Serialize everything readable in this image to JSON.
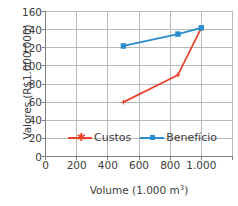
{
  "chart_data": {
    "type": "line",
    "title": "",
    "subtitle": "",
    "xlabel": "Volume (1.000 m³)",
    "xlabel_base": "Volume (1.000 m",
    "xlabel_sup": "3",
    "xlabel_tail": ")",
    "ylabel": "Valores (R$1.000.000)",
    "xlim": [
      0,
      1200
    ],
    "ylim": [
      0,
      160
    ],
    "xticks": [
      0,
      200,
      400,
      600,
      800,
      1000,
      1200
    ],
    "xticklabels": [
      "0",
      "200",
      "400",
      "600",
      "800",
      "1.000",
      ""
    ],
    "yticks": [
      0,
      20,
      40,
      60,
      80,
      100,
      120,
      140,
      160
    ],
    "yticklabels": [
      "0",
      "20",
      "40",
      "60",
      "80",
      "100",
      "120",
      "140",
      "160"
    ],
    "grid": true,
    "grid_color": "#b3b3b3",
    "legend_position": "inside-lower-center",
    "series": [
      {
        "name": "Custos",
        "color": "#E8412C",
        "marker": "star",
        "x": [
          500,
          850,
          1000
        ],
        "values": [
          60,
          90,
          142
        ]
      },
      {
        "name": "Benefício",
        "color": "#2B8CCF",
        "marker": "square",
        "x": [
          500,
          850,
          1000
        ],
        "values": [
          122,
          135,
          142
        ]
      }
    ]
  },
  "legend": {
    "entries": [
      {
        "label": "Custos"
      },
      {
        "label": "Benefício"
      }
    ]
  },
  "colors": {
    "custos": "#E8412C",
    "beneficio": "#2B8CCF",
    "axis": "#808080",
    "grid": "#b3b3b3",
    "text": "#3d3d3d",
    "background": "#ffffff"
  }
}
